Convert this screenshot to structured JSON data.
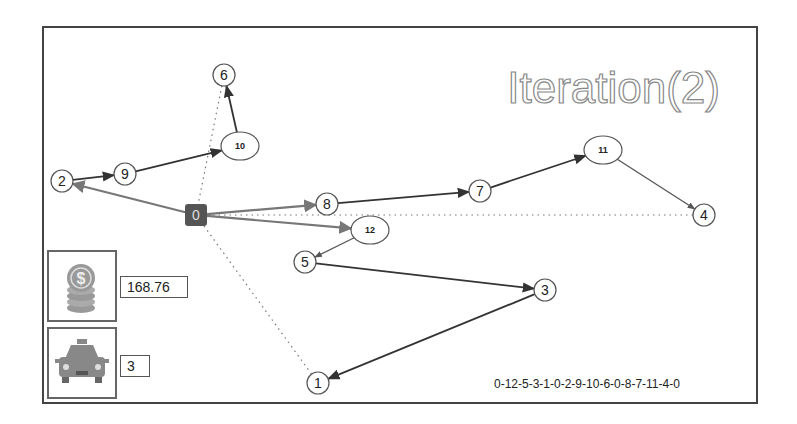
{
  "title": "Iteration(2)",
  "route_text": "0-12-5-3-1-0-2-9-10-6-0-8-7-11-4-0",
  "cost": {
    "icon": "coins-dollar-icon",
    "value": "168.76"
  },
  "vehicles": {
    "icon": "taxi-icon",
    "value": "3"
  },
  "colors": {
    "frame": "#444444",
    "edge_dark": "#333333",
    "edge_gray": "#777777",
    "depot": "#555555",
    "title_stroke": "#888888"
  },
  "nodes": [
    {
      "id": "0",
      "x": 196,
      "y": 215,
      "shape": "depot"
    },
    {
      "id": "1",
      "x": 318,
      "y": 383,
      "shape": "circle"
    },
    {
      "id": "2",
      "x": 62,
      "y": 181,
      "shape": "circle"
    },
    {
      "id": "3",
      "x": 545,
      "y": 290,
      "shape": "circle"
    },
    {
      "id": "4",
      "x": 704,
      "y": 215,
      "shape": "circle"
    },
    {
      "id": "5",
      "x": 305,
      "y": 262,
      "shape": "circle"
    },
    {
      "id": "6",
      "x": 224,
      "y": 75,
      "shape": "circle"
    },
    {
      "id": "7",
      "x": 480,
      "y": 191,
      "shape": "circle"
    },
    {
      "id": "8",
      "x": 327,
      "y": 204,
      "shape": "circle"
    },
    {
      "id": "9",
      "x": 125,
      "y": 174,
      "shape": "circle"
    },
    {
      "id": "10",
      "x": 240,
      "y": 146,
      "shape": "ellipse"
    },
    {
      "id": "11",
      "x": 603,
      "y": 150,
      "shape": "ellipse"
    },
    {
      "id": "12",
      "x": 370,
      "y": 230,
      "shape": "ellipse"
    }
  ],
  "edges": [
    {
      "from": "0",
      "to": "12",
      "style": "gray"
    },
    {
      "from": "12",
      "to": "5",
      "style": "thin"
    },
    {
      "from": "5",
      "to": "3",
      "style": "dark"
    },
    {
      "from": "3",
      "to": "1",
      "style": "dark"
    },
    {
      "from": "1",
      "to": "0",
      "style": "dotted"
    },
    {
      "from": "0",
      "to": "2",
      "style": "gray"
    },
    {
      "from": "2",
      "to": "9",
      "style": "dark"
    },
    {
      "from": "9",
      "to": "10",
      "style": "dark"
    },
    {
      "from": "10",
      "to": "6",
      "style": "dark"
    },
    {
      "from": "6",
      "to": "0",
      "style": "dotted"
    },
    {
      "from": "0",
      "to": "8",
      "style": "gray"
    },
    {
      "from": "8",
      "to": "7",
      "style": "dark"
    },
    {
      "from": "7",
      "to": "11",
      "style": "dark"
    },
    {
      "from": "11",
      "to": "4",
      "style": "thin"
    },
    {
      "from": "4",
      "to": "0",
      "style": "dotted"
    }
  ]
}
